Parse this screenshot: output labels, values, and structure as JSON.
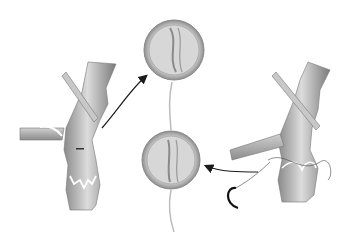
{
  "figure": {
    "type": "medical-illustration",
    "panels": [
      {
        "id": "left",
        "label": "vein with incompetent valve (before repair)"
      },
      {
        "id": "top-circle",
        "label": "valve viewed end-on (incompetent)"
      },
      {
        "id": "bottom-circle",
        "label": "valve viewed end-on (repaired)"
      },
      {
        "id": "right",
        "label": "vein with valve repaired by suture"
      }
    ],
    "colors": {
      "background": "#ffffff",
      "vessel_light": "#d9d9d9",
      "vessel_mid": "#a8a8a8",
      "vessel_dark": "#6e6e6e",
      "arrow": "#1a1a1a"
    }
  }
}
